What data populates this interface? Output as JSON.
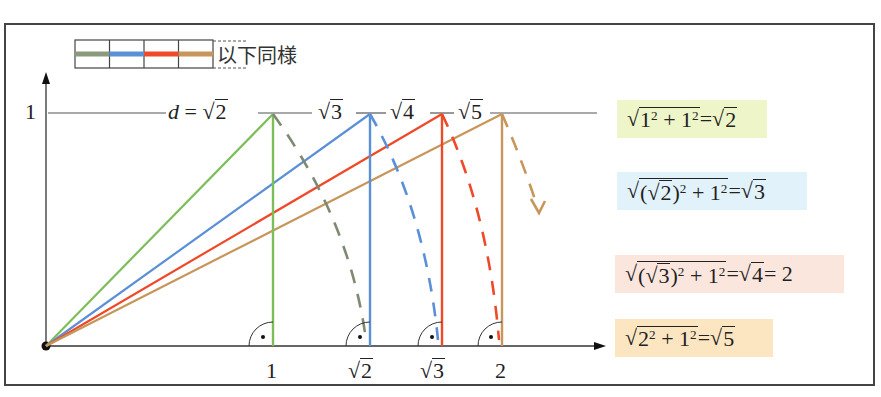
{
  "legend": {
    "swatches": [
      {
        "name": "step-1",
        "color": "#8a9a7a"
      },
      {
        "name": "step-2",
        "color": "#5b8fd6"
      },
      {
        "name": "step-3",
        "color": "#ee4a2a"
      },
      {
        "name": "step-4",
        "color": "#c8955a"
      }
    ],
    "text": "以下同様"
  },
  "axes": {
    "y_tick_label": "1",
    "x_tick_labels": [
      "1",
      "√2",
      "√3",
      "2"
    ]
  },
  "hypotenuse_labels": {
    "d_label": "d =",
    "values": [
      "√2",
      "√3",
      "√4",
      "√5"
    ]
  },
  "colors": {
    "green": "#7dbd5a",
    "blue": "#5b8fd6",
    "red": "#ee4a2a",
    "tan": "#c8955a",
    "gray_dash": "#7f8a72",
    "green_box": "#eef5c9",
    "blue_box": "#e2f2fb",
    "pink_box": "#fbe6de",
    "tan_box": "#fbe6c1"
  },
  "formulas": [
    {
      "id": "f1",
      "text": "√(1² + 1²) = √2"
    },
    {
      "id": "f2",
      "text": "√((√2)² + 1²) = √3"
    },
    {
      "id": "f3",
      "text": "√((√3)² + 1²) = √4 = 2"
    },
    {
      "id": "f4",
      "text": "√(2² + 1²) = √5"
    }
  ],
  "formula_parts": {
    "f1": {
      "rad_a": "1",
      "sup_a": "2",
      "plus": " + ",
      "rad_b": "1",
      "sup_b": "2",
      "eq": " = ",
      "result": "2"
    },
    "f2": {
      "open": "(",
      "inner": "2",
      "close": ")",
      "sup_a": "2",
      "plus": " + ",
      "rad_b": "1",
      "sup_b": "2",
      "eq": " = ",
      "result": "3"
    },
    "f3": {
      "open": "(",
      "inner": "3",
      "close": ")",
      "sup_a": "2",
      "plus": " + ",
      "rad_b": "1",
      "sup_b": "2",
      "eq": " = ",
      "result": "4",
      "eq2": " = 2"
    },
    "f4": {
      "rad_a": "2",
      "sup_a": "2",
      "plus": " + ",
      "rad_b": "1",
      "sup_b": "2",
      "eq": " = ",
      "result": "5"
    }
  }
}
